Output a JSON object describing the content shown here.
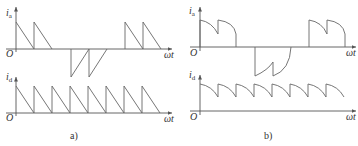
{
  "panels": [
    {
      "caption": "a)",
      "top_axis": {
        "var": "i",
        "sub": "a",
        "origin": "O",
        "x_label": "ωt"
      },
      "bottom_axis": {
        "var": "i",
        "sub": "d",
        "origin": "O",
        "x_label": "ωt"
      },
      "description": "Sawtooth (linearly decaying) current pulses; i_a shows two positive pulses, two negative pulses, two positive pulses; i_d shows eight sawtooth pulses"
    },
    {
      "caption": "b)",
      "top_axis": {
        "var": "i",
        "sub": "a",
        "origin": "O",
        "x_label": "ωt"
      },
      "bottom_axis": {
        "var": "i",
        "sub": "d",
        "origin": "O",
        "x_label": "ωt"
      },
      "description": "Curved (exponentially decaying) current pulses; i_d is continuous with ripple"
    }
  ],
  "colors": {
    "axis": "#555555",
    "wave": "#666666",
    "text": "#333333"
  }
}
